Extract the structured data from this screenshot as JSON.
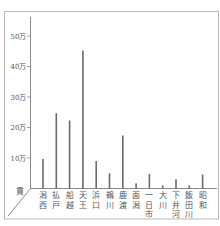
{
  "chart_data": {
    "type": "bar",
    "title": "",
    "xlabel": "",
    "ylabel": "貫",
    "categories": [
      "潟西",
      "払戸",
      "船越",
      "天王",
      "浜口",
      "鵜川",
      "鹿渡",
      "面潟",
      "一日市",
      "大川",
      "下井河",
      "飯田川",
      "昭和"
    ],
    "values": [
      97000,
      247000,
      223000,
      452000,
      90000,
      50000,
      174000,
      17000,
      48000,
      10000,
      30000,
      10000,
      46000
    ],
    "yticks": [
      "10万",
      "20万",
      "30万",
      "40万",
      "50万"
    ],
    "ytick_values": [
      100000,
      200000,
      300000,
      400000,
      500000
    ],
    "ylim": [
      0,
      560000
    ],
    "grid": false,
    "legend": null,
    "orientation": "vertical",
    "style": "pseudo-3d axes with diagonal depth line",
    "colors": {
      "bar": "#6a6a6a",
      "axis": "#8a8a8a",
      "frame": "#b8b8b8",
      "text": "#555555"
    }
  }
}
